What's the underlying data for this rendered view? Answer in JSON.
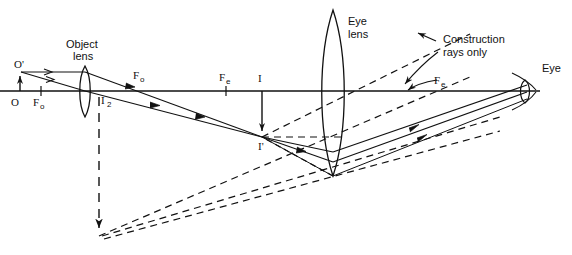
{
  "figure": {
    "background_color": "#ffffff",
    "line_color": "#111111",
    "width": 572,
    "height": 255
  },
  "labels": {
    "object_point": "O'",
    "axis_origin": "O",
    "object_focus_left": "F",
    "object_focus_left_sub": "o",
    "object_focus_right": "F",
    "object_focus_right_sub": "o",
    "object_lens_line1": "Object",
    "object_lens_line2": "lens",
    "intermediate_image_2": "I",
    "intermediate_image_2_sub": "2",
    "eye_focus_left": "F",
    "eye_focus_left_sub": "e",
    "image_axis": "I",
    "image_point": "I'",
    "eye_lens_line1": "Eye",
    "eye_lens_line2": "lens",
    "construction_line1": "Construction",
    "construction_line2": "rays only",
    "eye_focus_right": "F",
    "eye_focus_right_sub": "e",
    "eye": "Eye"
  },
  "optics": {
    "axis_y": 91,
    "axis_x_start": 0,
    "axis_x_end": 540,
    "object_lens_x": 85,
    "eye_lens_x": 333,
    "eye_x": 528,
    "object_height_top_y": 72,
    "image_point_x": 262,
    "image_point_y": 137,
    "virtual_image_arrow_x": 99,
    "virtual_image_arrow_y": 236
  },
  "annotations": {
    "ray_arrow_count_upper": 2,
    "ray_arrow_count_lower": 2,
    "construction_rays_style": "dashed",
    "real_rays_style": "solid"
  }
}
